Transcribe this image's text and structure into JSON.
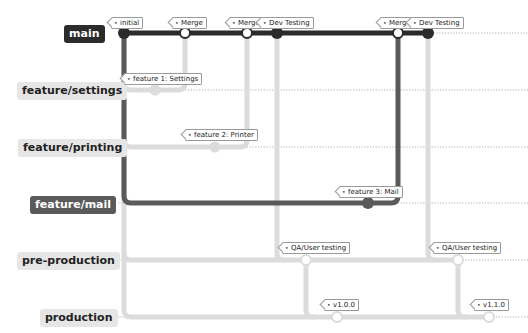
{
  "branches": [
    {
      "name": "main",
      "y": 33,
      "style": "dark"
    },
    {
      "name": "feature/settings",
      "y": 90,
      "style": "light"
    },
    {
      "name": "feature/printing",
      "y": 147,
      "style": "light"
    },
    {
      "name": "feature/mail",
      "y": 203,
      "style": "mid"
    },
    {
      "name": "pre-production",
      "y": 260,
      "style": "light"
    },
    {
      "name": "production",
      "y": 317,
      "style": "light"
    }
  ],
  "commits": {
    "initial": {
      "label": "initial",
      "branch": "main",
      "x": 124
    },
    "merge_settings": {
      "label": "Merge",
      "branch": "main",
      "x": 185
    },
    "merge_printing": {
      "label": "Merge",
      "branch": "main",
      "x": 247
    },
    "dev_testing_1": {
      "label": "Dev Testing",
      "branch": "main",
      "x": 277
    },
    "merge_mail": {
      "label": "Merge",
      "branch": "main",
      "x": 398
    },
    "dev_testing_2": {
      "label": "Dev Testing",
      "branch": "main",
      "x": 428
    },
    "feature_1": {
      "label": "feature 1: Settings",
      "branch": "feature/settings",
      "x": 155
    },
    "feature_2": {
      "label": "feature 2: Printer",
      "branch": "feature/printing",
      "x": 215
    },
    "feature_3": {
      "label": "feature 3: Mail",
      "branch": "feature/mail",
      "x": 368
    },
    "qa_1": {
      "label": "QA/User testing",
      "branch": "pre-production",
      "x": 306
    },
    "qa_2": {
      "label": "QA/User testing",
      "branch": "pre-production",
      "x": 458
    },
    "release_1": {
      "label": "v1.0.0",
      "branch": "production",
      "x": 337
    },
    "release_2": {
      "label": "v1.1.0",
      "branch": "production",
      "x": 489
    }
  },
  "colors": {
    "dark": "#2b2b2b",
    "mid": "#5a5a5a",
    "light": "#dcdcdc",
    "grid": "#9a9a9a"
  }
}
